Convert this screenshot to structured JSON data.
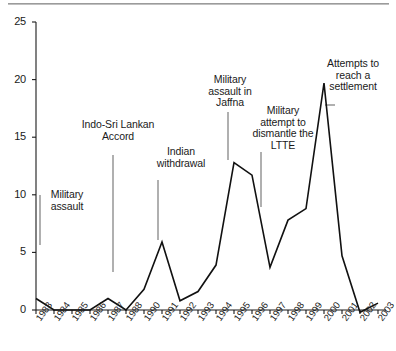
{
  "chart_data": {
    "type": "line",
    "title": "",
    "xlabel": "",
    "ylabel": "",
    "ylim": [
      0,
      25
    ],
    "yticks": [
      0,
      5,
      10,
      15,
      20,
      25
    ],
    "grid": false,
    "legend": "none",
    "line_color": "#111111",
    "categories": [
      "1983",
      "1984",
      "1985",
      "1986",
      "1987",
      "1988",
      "1990",
      "1991",
      "1992",
      "1993",
      "1994",
      "1995",
      "1996",
      "1997",
      "1998",
      "1999",
      "2000",
      "2001",
      "2002",
      "2003"
    ],
    "values": [
      1.0,
      0.0,
      0.0,
      0.0,
      1.0,
      0.0,
      1.8,
      5.9,
      0.8,
      1.6,
      3.9,
      12.8,
      11.7,
      3.7,
      7.8,
      8.8,
      19.7,
      4.7,
      -0.2,
      0.6
    ],
    "annotations": [
      {
        "text": "Military\nassault",
        "at_category": "1983",
        "note": "vertical leader line from ~2 to ~9"
      },
      {
        "text": "Indo-Sri Lankan\nAccord",
        "at_category": "1987",
        "note": "vertical leader line from ~3.3 to ~13.5"
      },
      {
        "text": "Indian\nwithdrawal",
        "at_category": "1990",
        "note": "vertical leader line from ~6 to ~11.5"
      },
      {
        "text": "Military\nassault in\nJaffna",
        "at_category": "1995",
        "note": "vertical leader line from ~13 to ~18"
      },
      {
        "text": "Military\nattempt to\ndismantle the\nLTTE",
        "at_category": "1997",
        "note": "vertical leader line from ~9 to ~14"
      },
      {
        "text": "Attempts to\nreach a\nsettlement",
        "at_category": "2001",
        "note": "short horizontal tick marker"
      }
    ]
  },
  "axes": {
    "y_tick_labels": [
      "25",
      "20",
      "15",
      "10",
      "5",
      "0"
    ],
    "x_tick_labels": [
      "1983",
      "1984",
      "1985",
      "1986",
      "1987",
      "1988",
      "1990",
      "1991",
      "1992",
      "1993",
      "1994",
      "1995",
      "1996",
      "1997",
      "1998",
      "1999",
      "2000",
      "2001",
      "2002",
      "2003"
    ]
  },
  "annotation_labels": {
    "a0": "Military\nassault",
    "a1": "Indo-Sri Lankan\nAccord",
    "a2": "Indian\nwithdrawal",
    "a3": "Military\nassault in\nJaffna",
    "a4": "Military\nattempt to\ndismantle the\nLTTE",
    "a5": "Attempts to\nreach a\nsettlement"
  }
}
